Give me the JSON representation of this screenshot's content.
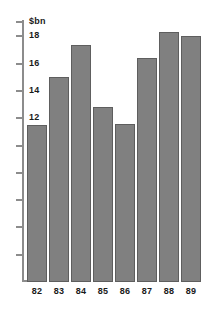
{
  "chart_data": {
    "type": "bar",
    "title": "",
    "subtitle": "",
    "xlabel": "",
    "ylabel": "$bn",
    "categories": [
      "82",
      "83",
      "84",
      "85",
      "86",
      "87",
      "88",
      "89"
    ],
    "values": [
      11.5,
      15.0,
      17.4,
      12.8,
      11.6,
      16.4,
      18.3,
      18.0
    ],
    "series": [
      {
        "name": "",
        "values": [
          11.5,
          15.0,
          17.4,
          12.8,
          11.6,
          16.4,
          18.3,
          18.0
        ]
      }
    ],
    "ylim": [
      0,
      19.2
    ],
    "y_ticks": [
      2,
      4,
      6,
      8,
      10,
      12,
      14,
      16,
      18
    ],
    "y_tick_labels": [
      "",
      "",
      "",
      "",
      "",
      "12",
      "14",
      "16",
      "18"
    ],
    "grid": false,
    "legend": false,
    "legend_position": "none",
    "bar_color": "#808080",
    "bar_edge_color": "#5e5e5e",
    "axis_color": "#8c8c8c",
    "text_color": "#1a1a1a",
    "background": "#ffffff"
  },
  "axis": {
    "unit_label": "$bn"
  }
}
